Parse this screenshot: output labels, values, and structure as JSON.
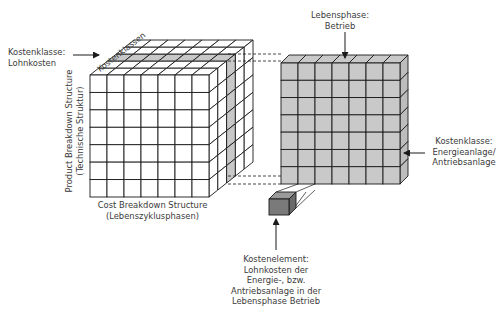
{
  "colors": {
    "line": "#1a1a1a",
    "cell_fill": "#ffffff",
    "highlight_fill": "#c8c8c8",
    "right_cube_fill": "#c9c9c9",
    "right_cube_side": "#bdbdbd",
    "element_front": "#7a7a7a",
    "element_top": "#9a9a9a",
    "element_side": "#6a6a6a",
    "text": "#3a3a3a"
  },
  "left_cube": {
    "columns": 7,
    "rows": 7,
    "depth": 5,
    "highlight_depth_index": 2,
    "axis_labels": {
      "top": "Kostenklassen",
      "left_line1": "Product Breakdown Structure",
      "left_line2": "(Technische Struktur)",
      "bottom_line1": "Cost Breakdown Structure",
      "bottom_line2": "(Lebenszyklusphasen)"
    }
  },
  "right_cube": {
    "columns": 7,
    "rows": 7,
    "depth": 1
  },
  "annotations": {
    "kostenklasse_lohn": {
      "line1": "Kostenklasse:",
      "line2": "Lohnkosten"
    },
    "lebensphase": {
      "line1": "Lebensphase:",
      "line2": "Betrieb"
    },
    "kostenklasse_energie": {
      "line1": "Kostenklasse:",
      "line2": "Energieanlage/",
      "line3": "Antriebsanlage"
    },
    "kostenelement": {
      "line1": "Kostenelement:",
      "line2": "Lohnkosten der",
      "line3": "Energie-, bzw.",
      "line4": "Antriebsanlage in der",
      "line5": "Lebensphase Betrieb"
    }
  }
}
